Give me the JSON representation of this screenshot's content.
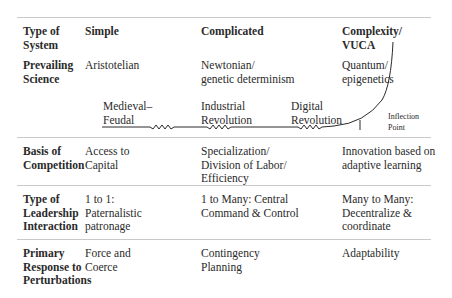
{
  "rows": [
    {
      "header": [
        "Type of",
        "System"
      ],
      "simple": [
        "Simple"
      ],
      "complicated": [
        "Complicated"
      ],
      "complex": [
        "Complexity/",
        "VUCA"
      ]
    },
    {
      "header": [
        "Prevailing",
        "Science"
      ],
      "simple": [
        "Aristotelian"
      ],
      "complicated": [
        "Newtonian/",
        "genetic determinism"
      ],
      "complex": [
        "Quantum/",
        "epigenetics"
      ]
    },
    {
      "header": [
        "Basis of",
        "Competition"
      ],
      "simple": [
        "Access to",
        "Capital"
      ],
      "complicated": [
        "Specialization/",
        "Division of Labor/",
        "Efficiency"
      ],
      "complex": [
        "Innovation based on",
        "adaptive learning"
      ]
    },
    {
      "header": [
        "Type of",
        "Leadership",
        "Interaction"
      ],
      "simple": [
        "1 to 1:",
        "Paternalistic",
        "patronage"
      ],
      "complicated": [
        "1 to Many: Central",
        "Command & Control"
      ],
      "complex": [
        "Many to Many:",
        "Decentralize &",
        "coordinate"
      ]
    },
    {
      "header": [
        "Primary",
        "Response to",
        "Perturbations"
      ],
      "simple": [
        "Force and",
        "Coerce"
      ],
      "complicated": [
        "Contingency",
        "Planning"
      ],
      "complex": [
        "Adaptability"
      ]
    }
  ],
  "timeline": {
    "eras": [
      [
        "Medieval–",
        "Feudal"
      ],
      [
        "Industrial",
        "Revolution"
      ],
      [
        "Digital",
        "Revolution"
      ]
    ],
    "inflection": [
      "Inflection",
      "Point"
    ]
  },
  "colors": {
    "text": "#2a2a2a",
    "rule": "#c9c9c9",
    "curve": "#2a2a2a"
  }
}
